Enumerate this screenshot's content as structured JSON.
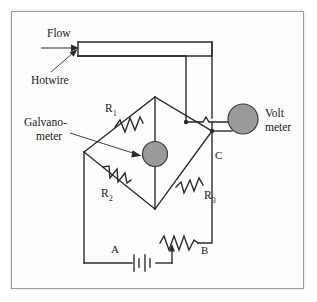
{
  "figure": {
    "type": "circuit-diagram",
    "border_color": "#9b9b9b",
    "background_color": "#fdfdfd",
    "wire_color": "#2b2b2b",
    "meter_fill_color": "#9a9a9a"
  },
  "labels": {
    "flow": "Flow",
    "hotwire": "Hotwire",
    "galvanometer_line1": "Galvano-",
    "galvanometer_line2": "meter",
    "voltmeter_line1": "Volt",
    "voltmeter_line2": "meter",
    "node_c": "C",
    "node_a": "A",
    "node_b": "B"
  },
  "resistors": [
    {
      "id": "r1",
      "base": "R",
      "subscript": "1",
      "position": "upper-left-arm"
    },
    {
      "id": "r2",
      "base": "R",
      "subscript": "2",
      "position": "lower-left-arm"
    },
    {
      "id": "r3",
      "base": "R",
      "subscript": "3",
      "position": "lower-right-arm"
    }
  ],
  "components": {
    "galvanometer": {
      "name": "galvanometer",
      "shape": "filled-circle",
      "on": "bridge-center"
    },
    "voltmeter": {
      "name": "voltmeter",
      "shape": "filled-circle",
      "on": "right-branch"
    },
    "battery": {
      "name": "battery",
      "cells": 2,
      "label": "A"
    },
    "rheostat": {
      "name": "rheostat",
      "has_wiper": true,
      "label": "B"
    },
    "hotwire": {
      "name": "hotwire",
      "shape": "open-rectangle",
      "label": "Hotwire"
    }
  }
}
